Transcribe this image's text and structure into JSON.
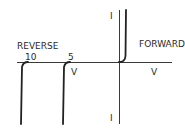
{
  "diagram": {
    "labels": {
      "current_top": "I",
      "current_bottom": "I",
      "reverse": "REVERSE",
      "forward": "FORWARD",
      "voltage_reverse": "V",
      "voltage_forward": "V",
      "breakdown_10": "10",
      "breakdown_5": "5"
    },
    "colors": {
      "background": "#ffffff",
      "line": "#222222",
      "axis": "#3a3a3a"
    }
  }
}
